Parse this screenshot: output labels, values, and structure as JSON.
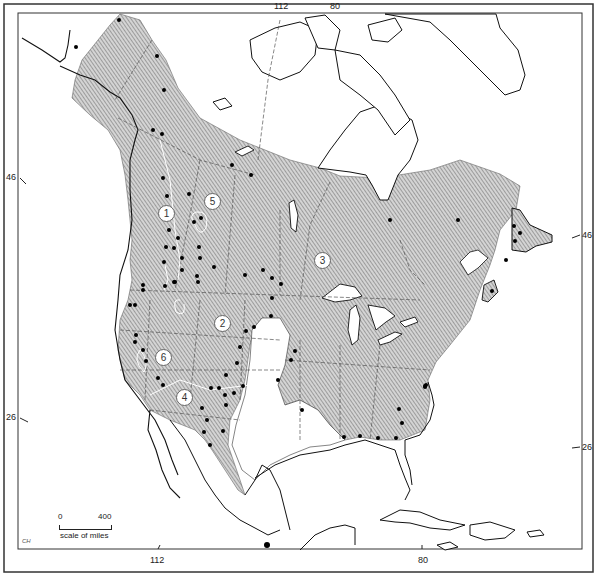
{
  "figure": {
    "type": "range-map",
    "colors": {
      "range_fill": "#cfcfcf",
      "hatch": "#7a7a7a",
      "coast": "#111111",
      "border": "#333333",
      "dot": "#000000"
    }
  },
  "graticule": {
    "top_labels": [
      {
        "text": "112"
      },
      {
        "text": "80"
      }
    ],
    "bottom_labels": [
      {
        "text": "112"
      },
      {
        "text": "80"
      }
    ],
    "left_labels": [
      {
        "text": "46"
      },
      {
        "text": "26"
      }
    ],
    "right_labels": [
      {
        "text": "46"
      },
      {
        "text": "26"
      }
    ]
  },
  "regions": [
    {
      "id": "1",
      "label": "1"
    },
    {
      "id": "2",
      "label": "2"
    },
    {
      "id": "3",
      "label": "3"
    },
    {
      "id": "4",
      "label": "4"
    },
    {
      "id": "5",
      "label": "5"
    },
    {
      "id": "6",
      "label": "6"
    }
  ],
  "scale": {
    "start": "0",
    "end": "400",
    "unit_label": "scale of miles"
  },
  "signature": "CH",
  "caption": ""
}
